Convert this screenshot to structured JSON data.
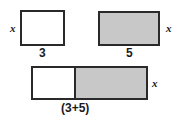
{
  "figure": {
    "background_color": "#ffffff",
    "border_color": "#2a2a2a",
    "shaded_fill": "#c8c8c8",
    "unshaded_fill": "#ffffff"
  },
  "shapes": [
    {
      "id": "rect-three",
      "name": "rectangle-width-three",
      "fill": "unshaded",
      "width_label": "3",
      "height_label": "x",
      "height_label_side": "left"
    },
    {
      "id": "rect-five",
      "name": "rectangle-width-five",
      "fill": "shaded",
      "width_label": "5",
      "height_label": "x",
      "height_label_side": "right"
    },
    {
      "id": "rect-sum",
      "name": "rectangle-combined",
      "fill": "split",
      "width_label": "(3+5)",
      "height_label": "x",
      "height_label_side": "right",
      "left_part_fill": "unshaded",
      "right_part_fill": "shaded"
    }
  ],
  "labels": {
    "x_left": "x",
    "x_right": "x",
    "x_sum": "x",
    "three": "3",
    "five": "5",
    "sum": "(3+5)"
  }
}
